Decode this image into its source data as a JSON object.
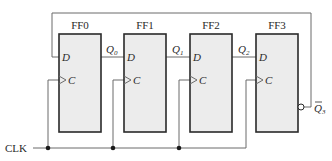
{
  "diagram": {
    "type": "johnson-counter",
    "flip_flops": [
      {
        "name": "FF0",
        "input_d": "D",
        "input_c": "C",
        "output": "Q",
        "output_sub": "0"
      },
      {
        "name": "FF1",
        "input_d": "D",
        "input_c": "C",
        "output": "Q",
        "output_sub": "1"
      },
      {
        "name": "FF2",
        "input_d": "D",
        "input_c": "C",
        "output": "Q",
        "output_sub": "2"
      },
      {
        "name": "FF3",
        "input_d": "D",
        "input_c": "C",
        "output": "Q",
        "output_sub": "3",
        "output_inverted": true
      }
    ],
    "clock_label": "CLK",
    "feedback": "Q̄3 → D of FF0",
    "colors": {
      "box_fill": "#ececec",
      "box_stroke": "#2a2a2a",
      "wire": "#6b6b6b"
    }
  }
}
